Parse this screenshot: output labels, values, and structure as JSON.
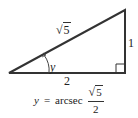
{
  "diagram": {
    "type": "right-triangle",
    "vertices": {
      "left": [
        9,
        73
      ],
      "bottom_right": [
        125,
        73
      ],
      "top_right": [
        125,
        10
      ]
    },
    "hypotenuse_label": {
      "radical": "√",
      "radicand": "5"
    },
    "vertical_side_label": "1",
    "horizontal_side_label": "2",
    "angle_label": "y",
    "right_angle_marker": true,
    "formula": {
      "lhs": "y",
      "equals": "=",
      "func": "arcsec",
      "numerator": {
        "radical": "√",
        "radicand": "5"
      },
      "denominator": "2"
    },
    "line_color": "#333333"
  }
}
